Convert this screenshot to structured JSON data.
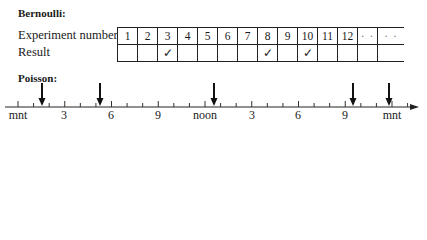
{
  "bernoulli": {
    "heading": "Bernoulli:",
    "row_labels": {
      "experiment": "Experiment number",
      "result": "Result"
    },
    "experiments": [
      "1",
      "2",
      "3",
      "4",
      "5",
      "6",
      "7",
      "8",
      "9",
      "10",
      "11",
      "12",
      "· ·",
      "· ·"
    ],
    "results": [
      "",
      "",
      "✓",
      "",
      "",
      "",
      "",
      "✓",
      "",
      "✓",
      "",
      "",
      "",
      ""
    ]
  },
  "poisson": {
    "heading": "Poisson:",
    "axis_labels": [
      {
        "text": "mnt",
        "x": 18
      },
      {
        "text": "3",
        "x": 64
      },
      {
        "text": "6",
        "x": 111
      },
      {
        "text": "9",
        "x": 158
      },
      {
        "text": "noon",
        "x": 205
      },
      {
        "text": "3",
        "x": 252
      },
      {
        "text": "6",
        "x": 298
      },
      {
        "text": "9",
        "x": 345
      },
      {
        "text": "mnt",
        "x": 392
      }
    ],
    "event_arrows_x": [
      42,
      100,
      214,
      353,
      389
    ]
  }
}
